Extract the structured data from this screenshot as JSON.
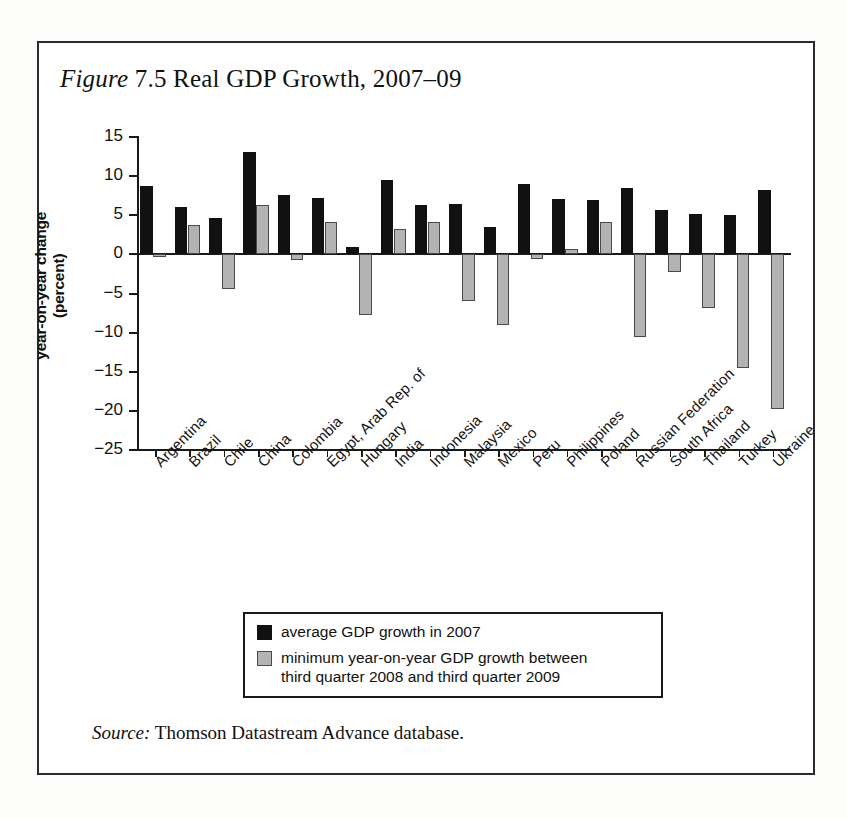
{
  "figure": {
    "label_word": "Figure",
    "number": "7.5",
    "title": "Real GDP Growth, 2007–09",
    "title_full": "Figure 7.5 Real GDP Growth, 2007–09"
  },
  "source": {
    "label": "Source:",
    "text": "Thomson Datastream Advance database."
  },
  "legend": {
    "items": [
      {
        "label": "average GDP growth in 2007",
        "color": "#111111",
        "swatch": "black"
      },
      {
        "label": "minimum year-on-year GDP growth between third quarter 2008 and third quarter 2009",
        "line1": "minimum year-on-year GDP growth between",
        "line2": "third quarter 2008 and third quarter 2009",
        "color": "#b3b3b3",
        "swatch": "gray"
      }
    ]
  },
  "axis": {
    "ylabel_line1": "year-on-year change",
    "ylabel_line2": "(percent)",
    "ylabel": "year-on-year change (percent)",
    "yticks": [
      "15",
      "10",
      "5",
      "0",
      "−5",
      "−10",
      "−15",
      "−20",
      "−25"
    ]
  },
  "chart_data": {
    "type": "bar",
    "title": "Figure 7.5 Real GDP Growth, 2007–09",
    "xlabel": "",
    "ylabel": "year-on-year change (percent)",
    "ylim": [
      -25,
      15
    ],
    "ytick_values": [
      15,
      10,
      5,
      0,
      -5,
      -10,
      -15,
      -20,
      -25
    ],
    "grid": false,
    "legend_position": "below-plot",
    "categories": [
      "Argentina",
      "Brazil",
      "Chile",
      "China",
      "Colombia",
      "Egypt, Arab Rep. of",
      "Hungary",
      "India",
      "Indonesia",
      "Malaysia",
      "Mexico",
      "Peru",
      "Philippines",
      "Poland",
      "Russian Federation",
      "South Africa",
      "Thailand",
      "Turkey",
      "Ukraine"
    ],
    "series": [
      {
        "name": "average GDP growth in 2007",
        "color": "#111111",
        "values": [
          8.7,
          6.1,
          4.7,
          13.1,
          7.6,
          7.2,
          1.0,
          9.5,
          6.3,
          6.5,
          3.5,
          9.0,
          7.1,
          7.0,
          8.5,
          5.7,
          5.2,
          5.0,
          8.2
        ]
      },
      {
        "name": "minimum year-on-year GDP growth between third quarter 2008 and third quarter 2009",
        "color": "#b3b3b3",
        "values": [
          -0.3,
          3.8,
          -4.4,
          6.3,
          -0.7,
          4.2,
          -7.8,
          3.3,
          4.1,
          -6.0,
          -9.0,
          -0.6,
          0.7,
          4.2,
          -10.6,
          -2.3,
          -6.9,
          -14.5,
          -19.8
        ]
      }
    ],
    "source": "Thomson Datastream Advance database."
  }
}
